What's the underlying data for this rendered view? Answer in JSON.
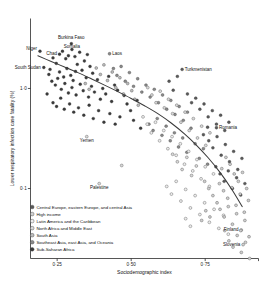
{
  "chart_data": {
    "type": "scatter",
    "title": "",
    "xlabel": "Sociodemographic index",
    "ylabel": "Lower respiratory infection case fatality (%)",
    "x_ticks": [
      "0·25",
      "0·50",
      "0·75"
    ],
    "x_tick_values": [
      0.25,
      0.5,
      0.75
    ],
    "y_ticks": [
      "1·0",
      "0·1"
    ],
    "y_tick_values": [
      1.0,
      0.1
    ],
    "y_scale": "log",
    "xlim": [
      0.16,
      0.93
    ],
    "ylim": [
      0.02,
      5.0
    ],
    "grid": false,
    "legend_position": "bottom-left",
    "legend": [
      {
        "label": "Central Europe, eastern Europe, and central Asia",
        "color": "#5a5a5a"
      },
      {
        "label": "High income",
        "color": "#cfcfcf"
      },
      {
        "label": "Latin America and the Caribbean",
        "color": "#ededed"
      },
      {
        "label": "North Africa and Middle East",
        "color": "#d9d9d9"
      },
      {
        "label": "South Asia",
        "color": "#bdbdbd"
      },
      {
        "label": "Southeast Asia, east Asia, and Oceania",
        "color": "#8a8a8a"
      },
      {
        "label": "Sub-Saharan Africa",
        "color": "#3a3a3a"
      }
    ],
    "annotations": [
      {
        "label": "Niger",
        "x": 0.192,
        "y": 2.35,
        "anchor": "end",
        "dx": -3.0,
        "dy": -1.0
      },
      {
        "label": "Chad",
        "x": 0.258,
        "y": 2.2,
        "anchor": "end",
        "dx": -2.6,
        "dy": 0.4
      },
      {
        "label": "Burkina Faso",
        "x": 0.298,
        "y": 2.8,
        "anchor": "middle",
        "dx": 0.0,
        "dy": -5.0
      },
      {
        "label": "Somalia",
        "x": 0.3,
        "y": 2.45,
        "anchor": "middle",
        "dx": 0.0,
        "dy": -1.6
      },
      {
        "label": "South Sudan",
        "x": 0.205,
        "y": 1.62,
        "anchor": "end",
        "dx": -3.0,
        "dy": 1.4
      },
      {
        "label": "Laos",
        "x": 0.427,
        "y": 2.22,
        "anchor": "start",
        "dx": 2.6,
        "dy": 1.3
      },
      {
        "label": "Turkmenistan",
        "x": 0.672,
        "y": 1.55,
        "anchor": "start",
        "dx": 2.6,
        "dy": 1.3
      },
      {
        "label": "Romania",
        "x": 0.788,
        "y": 0.405,
        "anchor": "start",
        "dx": 2.6,
        "dy": 1.3
      },
      {
        "label": "Yemen",
        "x": 0.35,
        "y": 0.33,
        "anchor": "middle",
        "dx": 0.0,
        "dy": 5.0
      },
      {
        "label": "Palestine",
        "x": 0.392,
        "y": 0.112,
        "anchor": "middle",
        "dx": 0.0,
        "dy": 5.0
      },
      {
        "label": "Finland",
        "x": 0.872,
        "y": 0.0385,
        "anchor": "end",
        "dx": -2.8,
        "dy": 1.4
      },
      {
        "label": "Slovenia",
        "x": 0.878,
        "y": 0.0275,
        "anchor": "end",
        "dx": -2.8,
        "dy": 1.4
      }
    ],
    "trend_line": {
      "name": "fitted trend",
      "x": [
        0.185,
        0.23,
        0.275,
        0.32,
        0.365,
        0.41,
        0.455,
        0.5,
        0.545,
        0.59,
        0.635,
        0.68,
        0.72,
        0.76,
        0.8,
        0.84,
        0.875
      ],
      "y": [
        2.12,
        1.86,
        1.64,
        1.44,
        1.25,
        1.08,
        0.93,
        0.795,
        0.672,
        0.56,
        0.452,
        0.352,
        0.272,
        0.203,
        0.145,
        0.098,
        0.066
      ]
    },
    "series": [
      {
        "name": "Sub-Saharan Africa",
        "color": "#3a3a3a",
        "points": [
          [
            0.192,
            2.35
          ],
          [
            0.258,
            2.2
          ],
          [
            0.298,
            2.8
          ],
          [
            0.3,
            2.45
          ],
          [
            0.205,
            1.62
          ],
          [
            0.236,
            2.02
          ],
          [
            0.247,
            1.78
          ],
          [
            0.268,
            2.35
          ],
          [
            0.279,
            1.98
          ],
          [
            0.288,
            2.12
          ],
          [
            0.31,
            2.08
          ],
          [
            0.318,
            1.74
          ],
          [
            0.326,
            2.3
          ],
          [
            0.334,
            1.52
          ],
          [
            0.342,
            1.88
          ],
          [
            0.352,
            2.18
          ],
          [
            0.361,
            1.66
          ],
          [
            0.37,
            1.42
          ],
          [
            0.258,
            1.46
          ],
          [
            0.272,
            1.3
          ],
          [
            0.283,
            1.58
          ],
          [
            0.296,
            1.35
          ],
          [
            0.304,
            1.2
          ],
          [
            0.312,
            1.48
          ],
          [
            0.222,
            1.38
          ],
          [
            0.232,
            1.18
          ],
          [
            0.244,
            1.08
          ],
          [
            0.252,
            1.26
          ],
          [
            0.264,
            0.98
          ],
          [
            0.276,
            1.12
          ],
          [
            0.288,
            0.9
          ],
          [
            0.3,
            1.02
          ],
          [
            0.314,
            0.86
          ],
          [
            0.328,
            1.1
          ],
          [
            0.338,
            0.95
          ],
          [
            0.348,
            1.28
          ],
          [
            0.356,
            0.82
          ],
          [
            0.366,
            1.05
          ],
          [
            0.376,
            0.92
          ],
          [
            0.386,
            1.22
          ],
          [
            0.396,
            0.78
          ],
          [
            0.404,
            1.0
          ],
          [
            0.414,
            0.88
          ],
          [
            0.424,
            1.32
          ],
          [
            0.434,
            0.74
          ],
          [
            0.444,
            1.08
          ],
          [
            0.454,
            0.96
          ],
          [
            0.236,
            0.72
          ],
          [
            0.248,
            0.66
          ],
          [
            0.262,
            0.8
          ],
          [
            0.274,
            0.62
          ],
          [
            0.292,
            0.7
          ],
          [
            0.306,
            0.58
          ],
          [
            0.322,
            0.64
          ],
          [
            0.34,
            0.54
          ],
          [
            0.358,
            0.68
          ],
          [
            0.372,
            0.5
          ],
          [
            0.39,
            0.6
          ],
          [
            0.408,
            0.46
          ],
          [
            0.428,
            0.56
          ],
          [
            0.446,
            0.44
          ],
          [
            0.462,
            0.52
          ],
          [
            0.476,
            0.85
          ],
          [
            0.486,
            0.7
          ],
          [
            0.498,
            0.6
          ],
          [
            0.508,
            0.48
          ],
          [
            0.52,
            0.76
          ],
          [
            0.532,
            0.4
          ],
          [
            0.216,
            0.88
          ],
          [
            0.226,
            1.55
          ]
        ]
      },
      {
        "name": "South Asia",
        "color": "#bdbdbd",
        "points": [
          [
            0.382,
            1.6
          ],
          [
            0.396,
            1.38
          ],
          [
            0.408,
            1.72
          ],
          [
            0.42,
            1.2
          ],
          [
            0.436,
            1.46
          ],
          [
            0.448,
            1.02
          ],
          [
            0.462,
            1.28
          ],
          [
            0.474,
            0.88
          ],
          [
            0.488,
            1.12
          ],
          [
            0.502,
            0.95
          ],
          [
            0.345,
            1.12
          ],
          [
            0.358,
            0.98
          ],
          [
            0.512,
            0.78
          ],
          [
            0.524,
            0.68
          ]
        ]
      },
      {
        "name": "Southeast Asia, east Asia, and Oceania",
        "color": "#8a8a8a",
        "points": [
          [
            0.427,
            2.22
          ],
          [
            0.44,
            1.58
          ],
          [
            0.452,
            1.35
          ],
          [
            0.466,
            1.66
          ],
          [
            0.48,
            1.18
          ],
          [
            0.494,
            1.44
          ],
          [
            0.508,
            1.05
          ],
          [
            0.522,
            1.25
          ],
          [
            0.536,
            0.92
          ],
          [
            0.55,
            1.08
          ],
          [
            0.564,
            0.82
          ],
          [
            0.578,
            0.98
          ],
          [
            0.592,
            0.72
          ],
          [
            0.606,
            0.86
          ],
          [
            0.62,
            0.62
          ],
          [
            0.634,
            0.76
          ],
          [
            0.648,
            0.55
          ],
          [
            0.662,
            0.66
          ],
          [
            0.676,
            0.48
          ],
          [
            0.69,
            0.58
          ],
          [
            0.56,
            0.44
          ],
          [
            0.574,
            0.38
          ],
          [
            0.588,
            0.5
          ],
          [
            0.604,
            0.34
          ],
          [
            0.618,
            0.42
          ],
          [
            0.632,
            0.3
          ],
          [
            0.646,
            0.36
          ],
          [
            0.66,
            0.26
          ],
          [
            0.674,
            0.32
          ],
          [
            0.688,
            0.23
          ],
          [
            0.702,
            0.4
          ],
          [
            0.716,
            0.28
          ],
          [
            0.73,
            0.2
          ],
          [
            0.744,
            0.25
          ],
          [
            0.758,
            0.175
          ]
        ]
      },
      {
        "name": "North Africa and Middle East",
        "color": "#d9d9d9",
        "points": [
          [
            0.35,
            0.33
          ],
          [
            0.392,
            0.112
          ],
          [
            0.556,
            1.02
          ],
          [
            0.57,
            0.86
          ],
          [
            0.584,
            0.72
          ],
          [
            0.598,
            0.94
          ],
          [
            0.612,
            0.64
          ],
          [
            0.626,
            0.78
          ],
          [
            0.64,
            0.56
          ],
          [
            0.654,
            0.68
          ],
          [
            0.668,
            0.46
          ],
          [
            0.682,
            0.58
          ],
          [
            0.696,
            0.38
          ],
          [
            0.71,
            0.5
          ],
          [
            0.724,
            0.32
          ],
          [
            0.738,
            0.42
          ],
          [
            0.752,
            0.27
          ],
          [
            0.766,
            0.36
          ],
          [
            0.64,
            0.22
          ],
          [
            0.656,
            0.185
          ],
          [
            0.672,
            0.155
          ],
          [
            0.688,
            0.205
          ],
          [
            0.704,
            0.135
          ],
          [
            0.72,
            0.168
          ],
          [
            0.468,
            0.17
          ]
        ]
      },
      {
        "name": "Latin America and the Caribbean",
        "color": "#ededed",
        "points": [
          [
            0.54,
            0.52
          ],
          [
            0.554,
            0.44
          ],
          [
            0.568,
            0.36
          ],
          [
            0.582,
            0.46
          ],
          [
            0.596,
            0.3
          ],
          [
            0.61,
            0.38
          ],
          [
            0.624,
            0.25
          ],
          [
            0.638,
            0.33
          ],
          [
            0.652,
            0.215
          ],
          [
            0.666,
            0.28
          ],
          [
            0.68,
            0.175
          ],
          [
            0.694,
            0.235
          ],
          [
            0.708,
            0.15
          ],
          [
            0.722,
            0.195
          ],
          [
            0.736,
            0.125
          ],
          [
            0.75,
            0.165
          ],
          [
            0.764,
            0.105
          ],
          [
            0.778,
            0.14
          ],
          [
            0.62,
            0.105
          ],
          [
            0.636,
            0.088
          ],
          [
            0.652,
            0.118
          ],
          [
            0.668,
            0.075
          ],
          [
            0.684,
            0.098
          ],
          [
            0.7,
            0.064
          ],
          [
            0.716,
            0.085
          ],
          [
            0.732,
            0.055
          ],
          [
            0.748,
            0.072
          ],
          [
            0.764,
            0.046
          ],
          [
            0.78,
            0.062
          ],
          [
            0.796,
            0.04
          ],
          [
            0.812,
            0.054
          ],
          [
            0.828,
            0.035
          ],
          [
            0.7,
            0.042
          ],
          [
            0.684,
            0.05
          ]
        ]
      },
      {
        "name": "Central Europe, eastern Europe, and central Asia",
        "color": "#5a5a5a",
        "points": [
          [
            0.672,
            1.55
          ],
          [
            0.788,
            0.405
          ],
          [
            0.628,
            1.18
          ],
          [
            0.642,
            0.96
          ],
          [
            0.656,
            1.32
          ],
          [
            0.69,
            0.88
          ],
          [
            0.704,
            0.72
          ],
          [
            0.718,
            0.8
          ],
          [
            0.732,
            0.62
          ],
          [
            0.746,
            0.7
          ],
          [
            0.76,
            0.52
          ],
          [
            0.774,
            0.6
          ],
          [
            0.788,
            0.44
          ],
          [
            0.802,
            0.54
          ],
          [
            0.816,
            0.38
          ],
          [
            0.83,
            0.46
          ],
          [
            0.762,
            0.3
          ],
          [
            0.776,
            0.255
          ],
          [
            0.79,
            0.33
          ],
          [
            0.804,
            0.215
          ],
          [
            0.818,
            0.275
          ],
          [
            0.832,
            0.185
          ],
          [
            0.846,
            0.235
          ],
          [
            0.86,
            0.155
          ],
          [
            0.874,
            0.2
          ],
          [
            0.786,
            0.165
          ],
          [
            0.8,
            0.14
          ],
          [
            0.814,
            0.118
          ],
          [
            0.828,
            0.15
          ],
          [
            0.842,
            0.1
          ],
          [
            0.856,
            0.128
          ],
          [
            0.87,
            0.086
          ],
          [
            0.884,
            0.112
          ],
          [
            0.758,
            0.41
          ],
          [
            0.744,
            0.345
          ]
        ]
      },
      {
        "name": "High income",
        "color": "#cfcfcf",
        "points": [
          [
            0.872,
            0.0385
          ],
          [
            0.878,
            0.0275
          ],
          [
            0.798,
            0.112
          ],
          [
            0.812,
            0.095
          ],
          [
            0.826,
            0.08
          ],
          [
            0.84,
            0.102
          ],
          [
            0.854,
            0.068
          ],
          [
            0.868,
            0.088
          ],
          [
            0.882,
            0.058
          ],
          [
            0.896,
            0.076
          ],
          [
            0.8,
            0.062
          ],
          [
            0.814,
            0.052
          ],
          [
            0.828,
            0.066
          ],
          [
            0.842,
            0.044
          ],
          [
            0.856,
            0.056
          ],
          [
            0.87,
            0.038
          ],
          [
            0.884,
            0.048
          ],
          [
            0.898,
            0.033
          ],
          [
            0.83,
            0.03
          ],
          [
            0.844,
            0.026
          ],
          [
            0.858,
            0.034
          ],
          [
            0.872,
            0.023
          ],
          [
            0.886,
            0.029
          ],
          [
            0.9,
            0.02
          ],
          [
            0.816,
            0.038
          ],
          [
            0.79,
            0.072
          ],
          [
            0.776,
            0.085
          ],
          [
            0.762,
            0.1
          ],
          [
            0.748,
            0.118
          ],
          [
            0.806,
            0.158
          ],
          [
            0.82,
            0.205
          ],
          [
            0.834,
            0.175
          ],
          [
            0.848,
            0.14
          ],
          [
            0.862,
            0.118
          ],
          [
            0.876,
            0.145
          ],
          [
            0.89,
            0.1
          ],
          [
            0.766,
            0.052
          ],
          [
            0.752,
            0.06
          ],
          [
            0.738,
            0.048
          ]
        ]
      }
    ]
  }
}
